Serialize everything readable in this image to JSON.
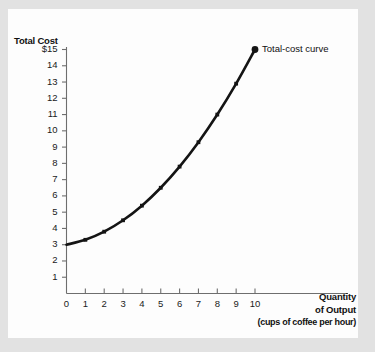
{
  "chart_data": {
    "type": "line",
    "title": "",
    "ylabel": "Total Cost",
    "xlabel": "Quantity of Output",
    "xlabel_line1": "Quantity",
    "xlabel_line2": "of Output",
    "xlabel_unit": "(cups of coffee per hour)",
    "series_label": "Total-cost curve",
    "x": [
      0,
      1,
      2,
      3,
      4,
      5,
      6,
      7,
      8,
      9,
      10
    ],
    "values": [
      3.0,
      3.3,
      3.8,
      4.5,
      5.4,
      6.5,
      7.8,
      9.3,
      11.0,
      12.9,
      15.0
    ],
    "xlim": [
      0,
      10
    ],
    "ylim": [
      0,
      15
    ],
    "xticks": [
      "0",
      "1",
      "2",
      "3",
      "4",
      "5",
      "6",
      "7",
      "8",
      "9",
      "10"
    ],
    "yticks": [
      "$15",
      "14",
      "13",
      "12",
      "11",
      "10",
      "9",
      "8",
      "7",
      "6",
      "5",
      "4",
      "3",
      "2",
      "1"
    ],
    "ytick_values": [
      15,
      14,
      13,
      12,
      11,
      10,
      9,
      8,
      7,
      6,
      5,
      4,
      3,
      2,
      1
    ],
    "origin_label": "0",
    "grid": false,
    "legend_position": "inline-right-endpoint",
    "marker": "square",
    "endpoint_marker": "circle",
    "curve_color": "#141414",
    "axis_color": "#6e6e6e",
    "background_color": "#fdfdfd",
    "page_background_color": "#e2e2e2"
  }
}
